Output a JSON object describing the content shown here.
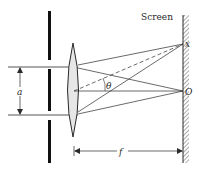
{
  "diagram": {
    "labels": {
      "screen": "Screen",
      "slit_separation": "a",
      "focal_length": "f",
      "angle": "θ",
      "point_x": "x",
      "point_origin": "O"
    },
    "colors": {
      "line": "#2a2a2a",
      "lens_fill": "#e6e6e6",
      "barrier": "#111111",
      "hatch": "#555555"
    },
    "elements": [
      "barrier-with-two-slits",
      "converging-lens",
      "screen-with-hatching",
      "incident-rays",
      "refracted-rays-to-x",
      "refracted-rays-to-O",
      "dashed-central-ray-at-angle-theta",
      "slit-separation-dimension-a",
      "focal-length-dimension-f"
    ]
  }
}
